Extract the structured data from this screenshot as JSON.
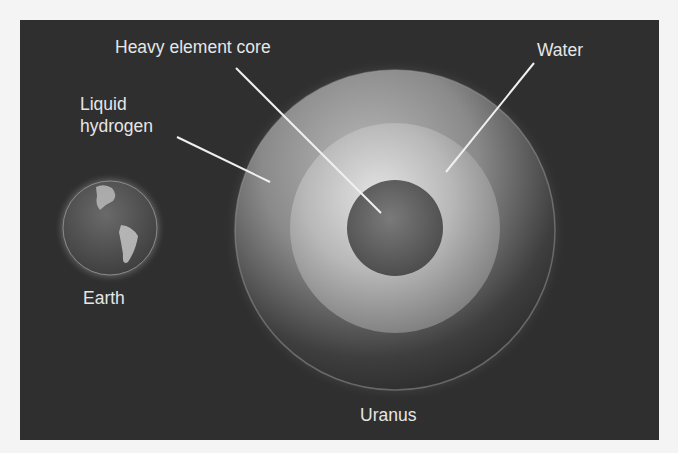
{
  "figure": {
    "type": "planet-interior-comparison",
    "background_color": "#2f2f2f",
    "label_color": "#e6e6e6"
  },
  "labels": {
    "heavy_element_core": "Heavy element core",
    "water": "Water",
    "liquid_hydrogen_line1": "Liquid",
    "liquid_hydrogen_line2": "hydrogen",
    "earth": "Earth",
    "uranus": "Uranus"
  },
  "bodies": [
    {
      "name": "Earth",
      "layers": [
        "surface"
      ]
    },
    {
      "name": "Uranus",
      "layers": [
        "Liquid hydrogen",
        "Water",
        "Heavy element core"
      ]
    }
  ]
}
